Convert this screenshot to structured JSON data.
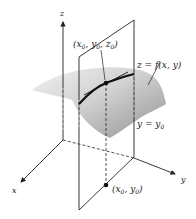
{
  "figure": {
    "axes": {
      "x_label": "x",
      "y_label": "y",
      "z_label": "z"
    },
    "labels": {
      "point_3d": {
        "main": "(x",
        "s1": "0",
        "c1": ", y",
        "s2": "0",
        "c2": ", z",
        "s3": "0",
        "end": ")"
      },
      "point_2d": {
        "main": "(x",
        "s1": "0",
        "c1": ", y",
        "s2": "0",
        "end": ")"
      },
      "surface_eq": "z = f(x, y)",
      "plane_eq": {
        "main": "y = y",
        "sub": "0"
      }
    },
    "colors": {
      "line": "#222222",
      "surface_light": "#e6e6e6",
      "surface_dark": "#8a8a8a",
      "background": "#ffffff"
    }
  }
}
